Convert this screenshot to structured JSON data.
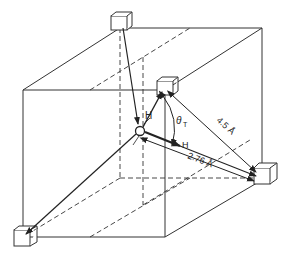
{
  "diagram": {
    "labels": {
      "h_upper": "H",
      "h_right": "H",
      "theta": "θ",
      "theta_sub": "T",
      "oo_far": "4.5 Å",
      "oo_near": "2.76 Å"
    },
    "nodes": [
      {
        "id": "center-oxygen",
        "x": 140,
        "y": 131
      },
      {
        "id": "top-left-molecule",
        "x": 120,
        "y": 28
      },
      {
        "id": "top-center-molecule",
        "x": 165,
        "y": 90
      },
      {
        "id": "right-molecule",
        "x": 260,
        "y": 180
      },
      {
        "id": "bottom-left-molecule",
        "x": 23,
        "y": 237
      }
    ],
    "colors": {
      "line": "#222222",
      "background": "#ffffff"
    }
  }
}
